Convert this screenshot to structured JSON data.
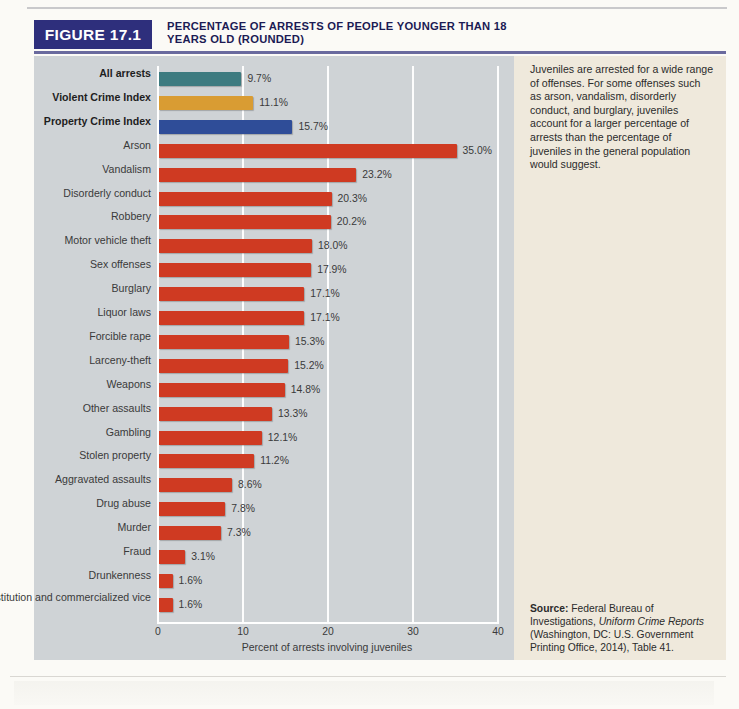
{
  "figure": {
    "tag": "FIGURE 17.1",
    "title": "PERCENTAGE OF ARRESTS OF PEOPLE YOUNGER THAN 18 YEARS OLD (ROUNDED)"
  },
  "side": {
    "caption": "Juveniles are arrested for a wide range of offenses. For some offenses such as arson, vandalism, disorderly conduct, and burglary, juveniles account for a larger percentage of arrests than the percentage of juveniles in the general population would suggest.",
    "source_label": "Source:",
    "source_text_1": " Federal Bureau of Investigations, ",
    "source_italic": "Uniform Crime Reports",
    "source_text_2": " (Washington, DC: U.S. Government Printing Office, 2014), Table 41."
  },
  "colors": {
    "panel_bg": "#cfd3d6",
    "side_bg": "#efe9dc",
    "header_navy": "#2e2f7c",
    "bar_red": "#cf3a22",
    "bar_teal": "#3d7b80",
    "bar_gold": "#d99c33",
    "bar_navy": "#2f4d98"
  },
  "chart_data": {
    "type": "bar",
    "orientation": "horizontal",
    "title": "PERCENTAGE OF ARRESTS OF PEOPLE YOUNGER THAN 18 YEARS OLD (ROUNDED)",
    "xlabel": "Percent of arrests involving juveniles",
    "ylabel": "",
    "xlim": [
      0,
      40
    ],
    "xticks": [
      0,
      10,
      20,
      30,
      40
    ],
    "xtick_labels": [
      "0",
      "10",
      "20",
      "30",
      "40"
    ],
    "grid": "vertical",
    "legend": "none",
    "value_suffix": "%",
    "categories": [
      "All arrests",
      "Violent Crime Index",
      "Property Crime Index",
      "Arson",
      "Vandalism",
      "Disorderly conduct",
      "Robbery",
      "Motor vehicle theft",
      "Sex offenses",
      "Burglary",
      "Liquor laws",
      "Forcible rape",
      "Larceny-theft",
      "Weapons",
      "Other assaults",
      "Gambling",
      "Stolen property",
      "Aggravated assaults",
      "Drug abuse",
      "Murder",
      "Fraud",
      "Drunkenness",
      "Prostitution and commercialized vice"
    ],
    "values": [
      9.7,
      11.1,
      15.7,
      35.0,
      23.2,
      20.3,
      20.2,
      18.0,
      17.9,
      17.1,
      17.1,
      15.3,
      15.2,
      14.8,
      13.3,
      12.1,
      11.2,
      8.6,
      7.8,
      7.3,
      3.1,
      1.6,
      1.6
    ],
    "value_labels": [
      "9.7%",
      "11.1%",
      "15.7%",
      "35.0%",
      "23.2%",
      "20.3%",
      "20.2%",
      "18.0%",
      "17.9%",
      "17.1%",
      "17.1%",
      "15.3%",
      "15.2%",
      "14.8%",
      "13.3%",
      "12.1%",
      "11.2%",
      "8.6%",
      "7.8%",
      "7.3%",
      "3.1%",
      "1.6%",
      "1.6%"
    ],
    "bar_colors": [
      "#3d7b80",
      "#d99c33",
      "#2f4d98",
      "#cf3a22",
      "#cf3a22",
      "#cf3a22",
      "#cf3a22",
      "#cf3a22",
      "#cf3a22",
      "#cf3a22",
      "#cf3a22",
      "#cf3a22",
      "#cf3a22",
      "#cf3a22",
      "#cf3a22",
      "#cf3a22",
      "#cf3a22",
      "#cf3a22",
      "#cf3a22",
      "#cf3a22",
      "#cf3a22",
      "#cf3a22",
      "#cf3a22"
    ],
    "bold_categories": [
      "All arrests",
      "Violent Crime Index",
      "Property Crime Index"
    ]
  }
}
